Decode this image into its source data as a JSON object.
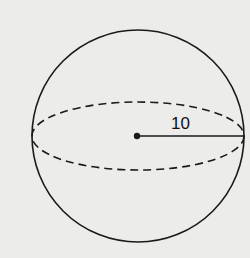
{
  "diagram": {
    "shape": "sphere",
    "radius_label": "10",
    "colors": {
      "background": "#ececea",
      "stroke": "#1a1a1a"
    }
  }
}
